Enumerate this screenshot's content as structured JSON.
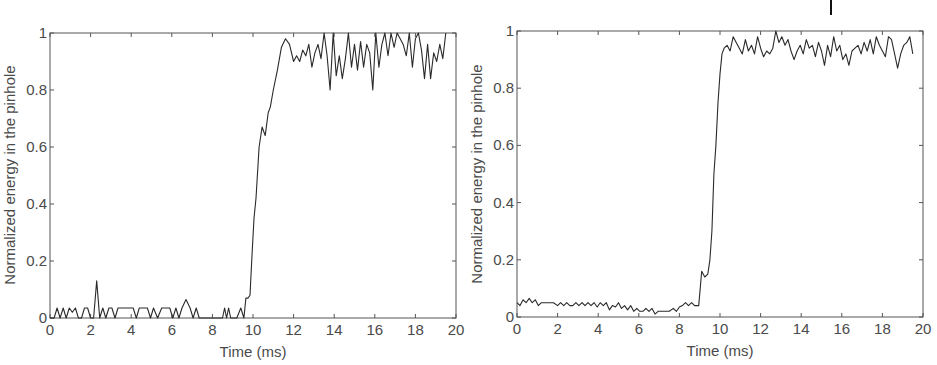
{
  "chart_data": [
    {
      "type": "line",
      "title": "",
      "xlabel": "Time (ms)",
      "ylabel": "Normalized energy in the pinhole",
      "xlim": [
        0,
        20
      ],
      "ylim": [
        0,
        1
      ],
      "xticks": [
        0,
        2,
        4,
        6,
        8,
        10,
        12,
        14,
        16,
        18,
        20
      ],
      "yticks": [
        0,
        0.2,
        0.4,
        0.6,
        0.8,
        1
      ],
      "ytick_labels": [
        "0",
        "0.2",
        "0.4",
        "0.6",
        "0.8",
        "1"
      ],
      "grid": false,
      "legend": null,
      "series": [
        {
          "name": "left",
          "x": [
            0,
            0.2,
            0.35,
            0.5,
            0.65,
            0.8,
            0.95,
            1.1,
            1.25,
            1.4,
            1.55,
            1.7,
            1.85,
            2.0,
            2.15,
            2.3,
            2.45,
            2.6,
            2.75,
            2.9,
            3.05,
            3.2,
            3.35,
            3.5,
            3.7,
            3.9,
            4.1,
            4.25,
            4.4,
            4.6,
            4.8,
            4.95,
            5.1,
            5.3,
            5.5,
            5.7,
            5.9,
            6.05,
            6.2,
            6.35,
            6.5,
            6.7,
            6.9,
            7.05,
            7.2,
            7.35,
            7.5,
            7.7,
            7.9,
            8.1,
            8.3,
            8.5,
            8.6,
            8.7,
            8.8,
            8.9,
            9.0,
            9.2,
            9.4,
            9.55,
            9.65,
            9.75,
            9.85,
            9.95,
            10.05,
            10.15,
            10.3,
            10.45,
            10.6,
            10.75,
            10.85,
            11.0,
            11.2,
            11.4,
            11.6,
            11.8,
            12.0,
            12.15,
            12.3,
            12.45,
            12.6,
            12.75,
            12.9,
            13.05,
            13.2,
            13.35,
            13.5,
            13.65,
            13.8,
            13.95,
            14.1,
            14.25,
            14.4,
            14.55,
            14.7,
            14.85,
            15.0,
            15.15,
            15.3,
            15.45,
            15.6,
            15.75,
            15.9,
            16.05,
            16.2,
            16.35,
            16.5,
            16.65,
            16.8,
            16.95,
            17.1,
            17.25,
            17.4,
            17.55,
            17.7,
            17.85,
            18.0,
            18.15,
            18.3,
            18.45,
            18.6,
            18.75,
            18.9,
            19.05,
            19.2,
            19.35,
            19.5,
            19.65,
            19.8
          ],
          "values": [
            0,
            0,
            0.035,
            0,
            0.035,
            0,
            0.035,
            0.02,
            0.035,
            0,
            0,
            0.035,
            0.035,
            0,
            0,
            0.13,
            0,
            0.035,
            0,
            0.035,
            0.035,
            0,
            0.035,
            0.035,
            0.035,
            0.035,
            0.035,
            0,
            0.035,
            0.035,
            0.035,
            0,
            0.035,
            0,
            0.035,
            0.035,
            0.035,
            0,
            0.035,
            0,
            0.035,
            0.065,
            0.035,
            0,
            0.035,
            0,
            0,
            0,
            0,
            0,
            0,
            0,
            0.035,
            0,
            0.035,
            0,
            0,
            0,
            0.035,
            0,
            0.07,
            0.07,
            0.08,
            0.22,
            0.35,
            0.42,
            0.6,
            0.67,
            0.64,
            0.72,
            0.74,
            0.8,
            0.87,
            0.95,
            0.98,
            0.96,
            0.9,
            0.92,
            0.9,
            0.94,
            0.92,
            0.96,
            0.88,
            0.93,
            0.96,
            0.91,
            1.0,
            0.92,
            0.8,
            1.0,
            0.85,
            0.92,
            0.84,
            0.91,
            1.0,
            0.88,
            0.96,
            0.87,
            0.97,
            0.88,
            0.96,
            0.93,
            0.8,
            1.0,
            0.88,
            0.96,
            1.0,
            0.92,
            1.0,
            0.95,
            1.0,
            0.98,
            0.96,
            0.92,
            1.0,
            0.88,
            0.98,
            1.0,
            0.94,
            0.84,
            0.96,
            0.84,
            0.93,
            0.9,
            0.96,
            0.91,
            1.0
          ]
        }
      ]
    },
    {
      "type": "line",
      "title": "",
      "xlabel": "Time (ms)",
      "ylabel": "Normalized energy in the pinhole",
      "xlim": [
        0,
        20
      ],
      "ylim": [
        0,
        1
      ],
      "xticks": [
        0,
        2,
        4,
        6,
        8,
        10,
        12,
        14,
        16,
        18,
        20
      ],
      "yticks": [
        0,
        0.2,
        0.4,
        0.6,
        0.8,
        1
      ],
      "ytick_labels": [
        "0",
        "0.2",
        "0.4",
        "0.6",
        "0.8",
        "1"
      ],
      "grid": false,
      "legend": null,
      "series": [
        {
          "name": "right",
          "x": [
            0,
            0.15,
            0.3,
            0.45,
            0.6,
            0.75,
            0.9,
            1.05,
            1.2,
            1.4,
            1.6,
            1.8,
            2.0,
            2.15,
            2.3,
            2.45,
            2.6,
            2.75,
            2.9,
            3.05,
            3.2,
            3.35,
            3.5,
            3.65,
            3.8,
            3.95,
            4.1,
            4.25,
            4.4,
            4.55,
            4.7,
            4.85,
            5.0,
            5.15,
            5.3,
            5.45,
            5.6,
            5.75,
            5.9,
            6.05,
            6.2,
            6.35,
            6.5,
            6.65,
            6.8,
            6.95,
            7.1,
            7.3,
            7.5,
            7.7,
            7.85,
            8.0,
            8.15,
            8.3,
            8.45,
            8.6,
            8.75,
            8.95,
            9.1,
            9.25,
            9.4,
            9.5,
            9.6,
            9.7,
            9.8,
            9.9,
            10.0,
            10.1,
            10.2,
            10.35,
            10.5,
            10.65,
            10.8,
            10.95,
            11.1,
            11.25,
            11.4,
            11.55,
            11.7,
            11.85,
            12.0,
            12.15,
            12.3,
            12.45,
            12.6,
            12.75,
            12.9,
            13.05,
            13.2,
            13.35,
            13.5,
            13.65,
            13.8,
            13.95,
            14.1,
            14.25,
            14.4,
            14.55,
            14.7,
            14.85,
            15.0,
            15.15,
            15.3,
            15.45,
            15.6,
            15.75,
            15.9,
            16.05,
            16.2,
            16.35,
            16.5,
            16.65,
            16.8,
            16.95,
            17.1,
            17.25,
            17.4,
            17.55,
            17.7,
            17.85,
            18.0,
            18.15,
            18.3,
            18.45,
            18.6,
            18.75,
            18.9,
            19.05,
            19.2,
            19.35,
            19.5,
            19.65
          ],
          "values": [
            0.05,
            0.04,
            0.06,
            0.05,
            0.065,
            0.05,
            0.06,
            0.04,
            0.05,
            0.05,
            0.05,
            0.05,
            0.04,
            0.05,
            0.04,
            0.05,
            0.04,
            0.04,
            0.05,
            0.04,
            0.05,
            0.04,
            0.05,
            0.04,
            0.05,
            0.035,
            0.05,
            0.04,
            0.05,
            0.025,
            0.04,
            0.035,
            0.05,
            0.03,
            0.04,
            0.025,
            0.04,
            0.02,
            0.03,
            0.02,
            0.02,
            0.03,
            0.02,
            0.03,
            0.01,
            0.02,
            0.02,
            0.02,
            0.02,
            0.03,
            0.02,
            0.035,
            0.04,
            0.05,
            0.04,
            0.05,
            0.04,
            0.04,
            0.16,
            0.14,
            0.15,
            0.2,
            0.3,
            0.5,
            0.6,
            0.75,
            0.85,
            0.92,
            0.94,
            0.95,
            0.93,
            0.98,
            0.96,
            0.94,
            0.92,
            0.97,
            0.93,
            0.95,
            0.92,
            0.98,
            0.94,
            0.91,
            0.93,
            0.92,
            0.94,
            1.0,
            0.96,
            0.98,
            0.95,
            0.97,
            0.93,
            0.9,
            0.93,
            0.95,
            0.92,
            0.97,
            0.94,
            0.95,
            0.91,
            0.96,
            0.93,
            0.88,
            0.95,
            0.91,
            0.98,
            0.93,
            0.95,
            0.9,
            0.92,
            0.88,
            0.93,
            0.94,
            0.95,
            0.92,
            0.96,
            0.93,
            0.97,
            0.92,
            0.98,
            0.95,
            0.93,
            0.91,
            0.98,
            0.97,
            0.92,
            0.87,
            0.92,
            0.95,
            0.96,
            0.98,
            0.92
          ]
        }
      ]
    }
  ],
  "panels": [
    {
      "xlabel": "Time (ms)",
      "ylabel": "Normalized energy in the pinhole",
      "xtick_labels": [
        "0",
        "2",
        "4",
        "6",
        "8",
        "10",
        "12",
        "14",
        "16",
        "18",
        "20"
      ],
      "ytick_labels": [
        "0",
        "0.2",
        "0.4",
        "0.6",
        "0.8",
        "1"
      ]
    },
    {
      "xlabel": "Time (ms)",
      "ylabel": "Normalized energy in the pinhole",
      "xtick_labels": [
        "0",
        "2",
        "4",
        "6",
        "8",
        "10",
        "12",
        "14",
        "16",
        "18",
        "20"
      ],
      "ytick_labels": [
        "0",
        "0.2",
        "0.4",
        "0.6",
        "0.8",
        "1"
      ]
    }
  ]
}
